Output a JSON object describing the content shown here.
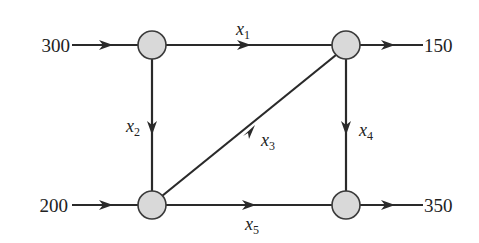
{
  "diagram": {
    "type": "network-flow",
    "nodes": [
      {
        "id": "A",
        "position": "top-left"
      },
      {
        "id": "B",
        "position": "top-right"
      },
      {
        "id": "C",
        "position": "bottom-left"
      },
      {
        "id": "D",
        "position": "bottom-right"
      }
    ],
    "external_flows": {
      "in_top_left": "300",
      "in_bottom_left": "200",
      "out_top_right": "150",
      "out_bottom_right": "350"
    },
    "edges": [
      {
        "from": "A",
        "to": "B",
        "var": "x",
        "sub": "1"
      },
      {
        "from": "A",
        "to": "C",
        "var": "x",
        "sub": "2"
      },
      {
        "from": "C",
        "to": "B",
        "var": "x",
        "sub": "3"
      },
      {
        "from": "B",
        "to": "D",
        "var": "x",
        "sub": "4"
      },
      {
        "from": "C",
        "to": "D",
        "var": "x",
        "sub": "5"
      }
    ],
    "colors": {
      "node_fill": "#d9d9d9",
      "line": "#2a2a2a",
      "background": "#ffffff"
    }
  }
}
